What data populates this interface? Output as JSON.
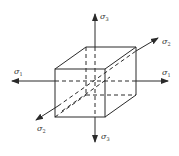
{
  "diagram": {
    "type": "principal-stress-cube",
    "colors": {
      "line": "#2a2a2a",
      "background": "#ffffff",
      "label": "#333333"
    },
    "labels": {
      "top": {
        "symbol": "σ",
        "subscript": "3"
      },
      "bottom": {
        "symbol": "σ",
        "subscript": "3"
      },
      "right": {
        "symbol": "σ",
        "subscript": "1"
      },
      "left": {
        "symbol": "σ",
        "subscript": "1"
      },
      "upper_right": {
        "symbol": "σ",
        "subscript": "2"
      },
      "lower_left": {
        "symbol": "σ",
        "subscript": "2"
      }
    }
  }
}
